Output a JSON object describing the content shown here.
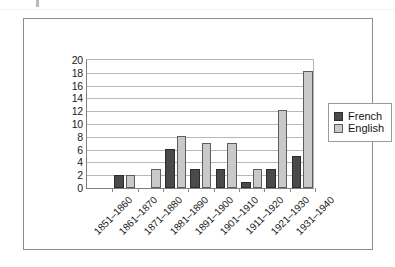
{
  "chart_data": {
    "type": "bar",
    "title": "",
    "subtitle": "",
    "xlabel": "",
    "ylabel": "",
    "ylim": [
      0,
      20
    ],
    "ytick_step": 2,
    "yticks": [
      20,
      18,
      16,
      14,
      12,
      10,
      8,
      6,
      4,
      2,
      0
    ],
    "grid": true,
    "legend_position": "right",
    "categories": [
      "1851–1860",
      "1861–1870",
      "1871–1880",
      "1881–1890",
      "1891–1900",
      "1901–1910",
      "1911–1920",
      "1921–1930",
      "1931–1940"
    ],
    "series": [
      {
        "name": "French",
        "color": "#4a4a4a",
        "values": [
          0,
          2,
          0,
          6,
          3,
          3,
          1,
          3,
          5
        ]
      },
      {
        "name": "English",
        "color": "#c9c9c9",
        "values": [
          0,
          2,
          3,
          8,
          7,
          7,
          3,
          12,
          18
        ]
      }
    ]
  },
  "legend": {
    "items": [
      {
        "label": "French",
        "swatch": "french"
      },
      {
        "label": "English",
        "swatch": "english"
      }
    ]
  }
}
